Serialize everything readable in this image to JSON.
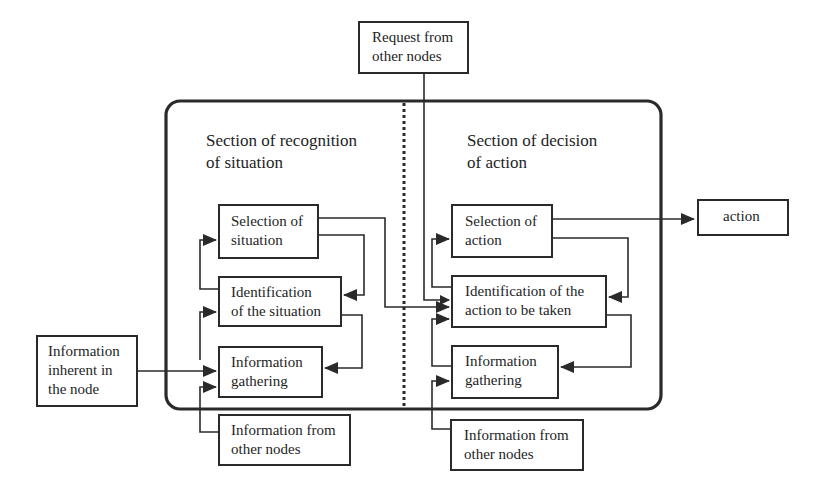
{
  "diagram": {
    "sections": {
      "recognition": "Section of recognition\nof situation",
      "decision": "Section of decision\nof action"
    },
    "external_inputs": {
      "request": "Request from\nother nodes",
      "inherent": "Information\ninherent in\nthe node",
      "info_other_left": "Information from\nother nodes",
      "info_other_right": "Information from\nother nodes"
    },
    "recognition_nodes": {
      "selection": "Selection of\nsituation",
      "identification": "Identification\nof the situation",
      "gathering": "Information\ngathering"
    },
    "decision_nodes": {
      "selection": "Selection of\naction",
      "identification": "Identification of the\naction to be taken",
      "gathering": "Information\ngathering"
    },
    "output": {
      "action": "action"
    },
    "colors": {
      "stroke": "#2a2a2a",
      "background": "#ffffff",
      "text": "#1e1e1e"
    }
  }
}
